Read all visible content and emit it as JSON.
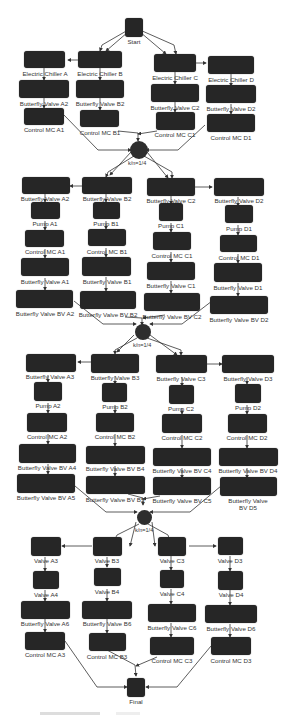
{
  "diagram": {
    "type": "flow-network",
    "start": {
      "label": "Start"
    },
    "final": {
      "label": "Final"
    },
    "gates": [
      {
        "label": "k/n=1/4"
      },
      {
        "label": "k/n=1/4"
      },
      {
        "label": "k/n=1/4"
      }
    ],
    "section1": {
      "columns": [
        {
          "nodes": [
            "Electric Chiller A",
            "Butterfly Valve A2",
            "Control MC A1"
          ]
        },
        {
          "nodes": [
            "Electric Chiller B",
            "Butterfly Valve B2",
            "Control MC B1"
          ]
        },
        {
          "nodes": [
            "Electric Chiller C",
            "Butterfly Valve C2",
            "Control MC C1"
          ]
        },
        {
          "nodes": [
            "Electric Chiller D",
            "Butterfly Valve D2",
            "Control MC D1"
          ]
        }
      ]
    },
    "section2": {
      "columns": [
        {
          "nodes": [
            "Butterfly Valve A2",
            "Pump A1",
            "Control MC A1",
            "Butterfly Valve A1",
            "Butterfly Valve BV A2"
          ]
        },
        {
          "nodes": [
            "Butterfly Valve B2",
            "Pump B1",
            "Control MC B1",
            "Butterfly Valve B1",
            "Butterfly Valve BV B2"
          ]
        },
        {
          "nodes": [
            "Butterfly Valve C2",
            "Pump C1",
            "Control MC C1",
            "Butterfly Valve C1",
            "Butterfly Valve BV C2"
          ]
        },
        {
          "nodes": [
            "Butterfly Valve D2",
            "Pump D1",
            "Control MC D1",
            "Butterfly Valve D1",
            "Butterfly Valve BV D2"
          ]
        }
      ]
    },
    "section3": {
      "columns": [
        {
          "nodes": [
            "Butterfly Valve A3",
            "Pump A2",
            "Control MC A2",
            "Butterfly Valve BV A4",
            "Butterfly Valve BV A5"
          ]
        },
        {
          "nodes": [
            "Butterfly Valve B3",
            "Pump B2",
            "Control MC B2",
            "Butterfly Valve BV B4",
            "Butterfly Valve BV B5"
          ]
        },
        {
          "nodes": [
            "Butterfly Valve C3",
            "Pump C2",
            "Control MC C2",
            "Butterfly Valve BV C4",
            "Butterfly Valve BV C5"
          ]
        },
        {
          "nodes": [
            "Butterfly Valve D3",
            "Pump D2",
            "Control MC D2",
            "Butterfly Valve BV D4",
            "Butterfly Valve BV D5"
          ]
        }
      ]
    },
    "section4": {
      "columns": [
        {
          "nodes": [
            "Valve A3",
            "Valve A4",
            "Butterfly Valve A6",
            "Control MC A3"
          ]
        },
        {
          "nodes": [
            "Valve B3",
            "Valve B4",
            "Butterfly Valve B6",
            "Control MC B3"
          ]
        },
        {
          "nodes": [
            "Valve C3",
            "Valve C4",
            "Butterfly Valve C6",
            "Control MC C3"
          ]
        },
        {
          "nodes": [
            "Valve D3",
            "Valve D4",
            "Butterfly Valve D6",
            "Control MC D3"
          ]
        }
      ]
    },
    "colors": {
      "node_fill": "#262626",
      "edge": "#333333",
      "background": "#ffffff",
      "label": "#333333"
    }
  }
}
